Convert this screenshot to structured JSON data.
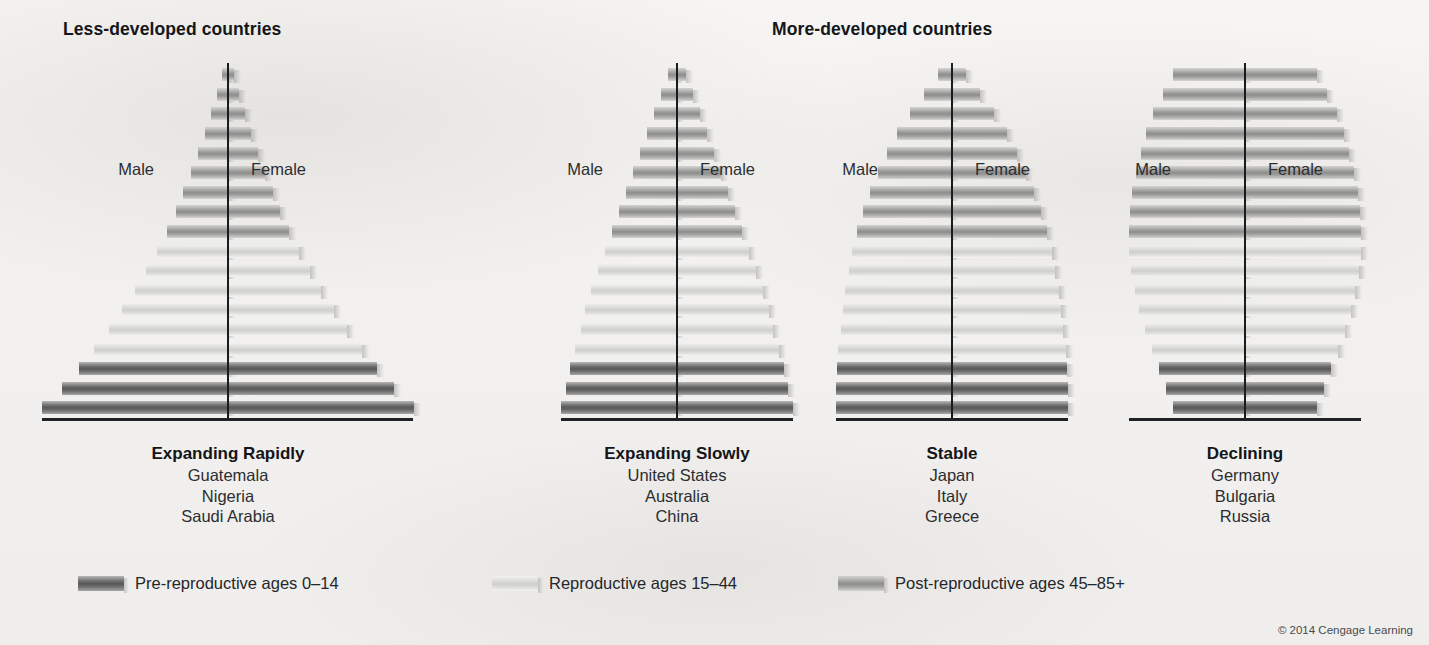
{
  "figure": {
    "headers": [
      {
        "id": "less-developed",
        "label": "Less-developed countries"
      },
      {
        "id": "more-developed",
        "label": "More-developed countries"
      }
    ],
    "male_label": "Male",
    "female_label": "Female",
    "credit": "© 2014 Cengage Learning"
  },
  "legend": {
    "items": [
      {
        "id": "pre-reproductive",
        "label": "Pre-reproductive ages 0–14",
        "band": "pre",
        "color": "#5f5f5f"
      },
      {
        "id": "reproductive",
        "label": "Reproductive ages 15–44",
        "band": "rep",
        "color": "#d8d8d5"
      },
      {
        "id": "post-reproductive",
        "label": "Post-reproductive ages 45–85+",
        "band": "post",
        "color": "#9a9a98"
      }
    ]
  },
  "chart_data": {
    "type": "bar",
    "orientation": "horizontal-diverging",
    "xlabel": "",
    "ylabel": "Age group",
    "grid": false,
    "legend_position": "bottom",
    "sides": [
      "Male",
      "Female"
    ],
    "note": "Values are relative bar half-widths (percent of panel half-width), bottom bar = youngest age group (0–4) to top bar = oldest (85+).",
    "age_groups": [
      "0–4",
      "5–9",
      "10–14",
      "15–19",
      "20–24",
      "25–29",
      "30–34",
      "35–39",
      "40–44",
      "45–49",
      "50–54",
      "55–59",
      "60–64",
      "65–69",
      "70–74",
      "75–79",
      "80–84",
      "85+"
    ],
    "band_map": [
      "pre",
      "pre",
      "pre",
      "rep",
      "rep",
      "rep",
      "rep",
      "rep",
      "rep",
      "post",
      "post",
      "post",
      "post",
      "post",
      "post",
      "post",
      "post",
      "post"
    ],
    "panels": [
      {
        "id": "expanding-rapidly",
        "title": "Expanding Rapidly",
        "group": "less-developed",
        "countries": [
          "Guatemala",
          "Nigeria",
          "Saudi Arabia"
        ],
        "values_bottom_to_top": [
          100,
          89,
          80,
          72,
          64,
          57,
          50,
          44,
          38,
          33,
          28,
          24,
          20,
          16,
          12.5,
          9,
          6,
          3
        ]
      },
      {
        "id": "expanding-slowly",
        "title": "Expanding Slowly",
        "group": "more-developed",
        "countries": [
          "United States",
          "Australia",
          "China"
        ],
        "values_bottom_to_top": [
          100,
          96,
          92,
          88,
          83,
          79,
          74,
          68,
          62,
          56,
          50,
          44,
          38,
          32,
          26,
          20,
          14,
          8
        ]
      },
      {
        "id": "stable",
        "title": "Stable",
        "group": "more-developed",
        "countries": [
          "Japan",
          "Italy",
          "Greece"
        ],
        "values_bottom_to_top": [
          100,
          100,
          99,
          98,
          96,
          94,
          92,
          89,
          86,
          82,
          77,
          71,
          64,
          56,
          47,
          36,
          24,
          12
        ]
      },
      {
        "id": "declining",
        "title": "Declining",
        "group": "more-developed",
        "countries": [
          "Germany",
          "Bulgaria",
          "Russia"
        ],
        "values_bottom_to_top": [
          62,
          68,
          74,
          80,
          86,
          91,
          95,
          98,
          100,
          100,
          99,
          97,
          94,
          90,
          85,
          79,
          71,
          62
        ]
      }
    ]
  },
  "layout": {
    "panels": [
      {
        "id": "expanding-rapidly",
        "center_x": 228,
        "axis_left": 42,
        "axis_right": 413,
        "half_width": 186,
        "baseline_y": 418,
        "bar_step": 19.6,
        "top_y": 63,
        "male_x": 154,
        "female_x": 251,
        "labels_x": 228,
        "caption_y": 443
      },
      {
        "id": "expanding-slowly",
        "center_x": 677,
        "axis_left": 561,
        "axis_right": 793,
        "half_width": 116,
        "baseline_y": 418,
        "bar_step": 19.6,
        "top_y": 63,
        "male_x": 603,
        "female_x": 700,
        "labels_x": 677,
        "caption_y": 443
      },
      {
        "id": "stable",
        "center_x": 952,
        "axis_left": 836,
        "axis_right": 1068,
        "half_width": 116,
        "baseline_y": 418,
        "bar_step": 19.6,
        "top_y": 63,
        "male_x": 878,
        "female_x": 975,
        "labels_x": 952,
        "caption_y": 443
      },
      {
        "id": "declining",
        "center_x": 1245,
        "axis_left": 1129,
        "axis_right": 1361,
        "half_width": 116,
        "baseline_y": 418,
        "bar_step": 19.6,
        "top_y": 63,
        "male_x": 1171,
        "female_x": 1268,
        "labels_x": 1245,
        "caption_y": 443
      }
    ],
    "male_female_y": 160,
    "legend_positions": [
      78,
      492,
      838
    ]
  }
}
